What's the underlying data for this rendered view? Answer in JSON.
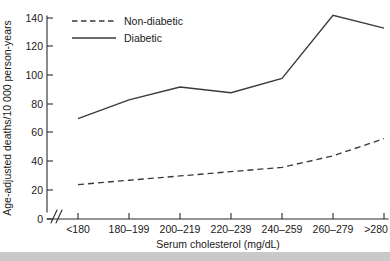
{
  "chart_data": {
    "type": "line",
    "title": "",
    "xlabel": "Serum cholesterol (mg/dL)",
    "ylabel": "Age-adjusted deaths/10 000 person-years",
    "categories": [
      "<180",
      "180–199",
      "200–219",
      "220–239",
      "240–259",
      "260–279",
      ">280"
    ],
    "series": [
      {
        "name": "Non-diabetic",
        "style": "dashed",
        "values": [
          24,
          27,
          30,
          33,
          36,
          44,
          56
        ]
      },
      {
        "name": "Diabetic",
        "style": "solid",
        "values": [
          70,
          83,
          92,
          88,
          98,
          142,
          133
        ]
      }
    ],
    "ylim": [
      0,
      140
    ],
    "yticks": [
      0,
      20,
      40,
      60,
      80,
      100,
      120,
      140
    ],
    "ytick_labels": [
      "0",
      "20",
      "40",
      "60",
      "80",
      "100",
      "120",
      "140"
    ],
    "grid": false,
    "legend_position": "top-center",
    "axis_break": "y-axis break near origin",
    "line_color": "#3a3a3a",
    "axis_color": "#2b2b2b"
  },
  "legend": {
    "entries": [
      {
        "label": "Non-diabetic"
      },
      {
        "label": "Diabetic"
      }
    ]
  },
  "axes": {
    "x_title": "Serum cholesterol (mg/dL)",
    "y_title": "Age-adjusted deaths/10 000 person-years"
  },
  "footer": {
    "bar_color": "#c9c9c9"
  }
}
